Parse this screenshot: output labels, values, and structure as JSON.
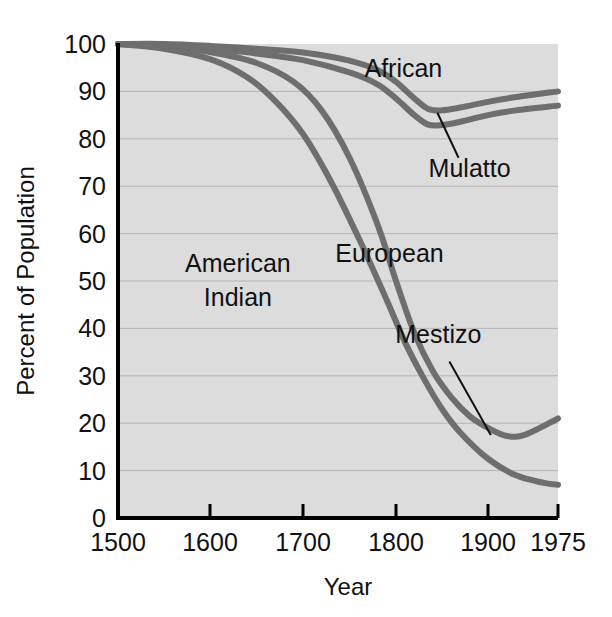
{
  "chart_data": {
    "type": "line",
    "title": "",
    "xlabel": "Year",
    "ylabel": "Percent of Population",
    "xlim": [
      1500,
      1975
    ],
    "ylim": [
      0,
      100
    ],
    "grid": true,
    "legend_position": "inline-annotations",
    "xticks": [
      "1500",
      "1600",
      "1700",
      "1800",
      "1900",
      "1975"
    ],
    "xtick_values": [
      1500,
      1600,
      1700,
      1800,
      1900,
      1975
    ],
    "yticks": [
      "0",
      "10",
      "20",
      "30",
      "40",
      "50",
      "60",
      "70",
      "80",
      "90",
      "100"
    ],
    "ytick_values": [
      0,
      10,
      20,
      30,
      40,
      50,
      60,
      70,
      80,
      90,
      100
    ],
    "series": [
      {
        "name": "African",
        "label": "African",
        "label_x": 1808,
        "label_y": 93,
        "pointer": false,
        "x": [
          1500,
          1550,
          1600,
          1650,
          1700,
          1750,
          1780,
          1800,
          1820,
          1835,
          1850,
          1870,
          1900,
          1930,
          1975
        ],
        "values": [
          100,
          100,
          99.6,
          99.0,
          98.2,
          96.5,
          94.5,
          92.0,
          88.5,
          86.3,
          86.0,
          86.6,
          87.8,
          88.8,
          90.0
        ]
      },
      {
        "name": "Mulatto",
        "label": "Mulatto",
        "label_x": 1880,
        "label_y": 72,
        "pointer": true,
        "pointer_from_x": 1868,
        "pointer_from_y": 76,
        "pointer_to_x": 1845,
        "pointer_to_y": 85.5,
        "x": [
          1500,
          1550,
          1600,
          1650,
          1700,
          1750,
          1780,
          1800,
          1820,
          1835,
          1850,
          1870,
          1900,
          1930,
          1975
        ],
        "values": [
          100,
          99.8,
          99.0,
          98.0,
          96.6,
          94.0,
          91.5,
          88.5,
          85.0,
          83.0,
          82.9,
          83.6,
          85.0,
          86.0,
          87.0
        ]
      },
      {
        "name": "European",
        "label": "European",
        "label_x": 1793,
        "label_y": 54,
        "pointer": false,
        "x": [
          1500,
          1550,
          1600,
          1650,
          1690,
          1720,
          1750,
          1780,
          1800,
          1820,
          1840,
          1860,
          1880,
          1900,
          1920,
          1940,
          1975
        ],
        "values": [
          100,
          99.5,
          98.3,
          96.0,
          92.0,
          86.0,
          76.0,
          62.0,
          50.0,
          39.0,
          31.0,
          25.5,
          21.5,
          19.0,
          17.3,
          17.6,
          21.0
        ]
      },
      {
        "name": "American Indian",
        "label": "American\nIndian",
        "label_line1": "American",
        "label_line2": "Indian",
        "label_x": 1630,
        "label_y": 52,
        "pointer": false,
        "x": [
          1500,
          1550,
          1600,
          1640,
          1670,
          1700,
          1730,
          1760,
          1790,
          1810,
          1830,
          1850,
          1870,
          1900,
          1930,
          1960,
          1975
        ],
        "values": [
          100,
          99.0,
          96.8,
          93.0,
          88.0,
          81.0,
          71.0,
          59.0,
          46.0,
          37.0,
          29.5,
          23.0,
          18.0,
          12.5,
          9.0,
          7.4,
          7.0
        ]
      },
      {
        "name": "Mestizo",
        "label": "Mestizo",
        "label_x": 1846,
        "label_y": 37,
        "pointer": true,
        "pointer_from_x": 1858,
        "pointer_from_y": 33,
        "pointer_to_x": 1903,
        "pointer_to_y": 17.5
      }
    ],
    "colors": {
      "line": "#6e6e6e",
      "plot_background": "#dcdcdc",
      "gridline": "#b4b4b4",
      "axis": "#000000",
      "text": "#111111"
    }
  }
}
